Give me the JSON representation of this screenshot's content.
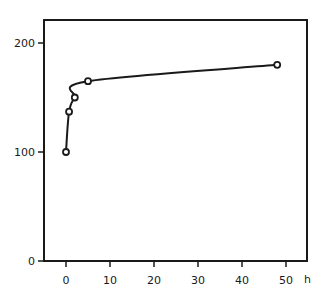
{
  "chart_data": {
    "type": "line",
    "title": "",
    "xlabel": "h",
    "ylabel": "",
    "xlim": [
      -4,
      56
    ],
    "ylim": [
      0,
      220
    ],
    "grid": false,
    "legend": null,
    "x_ticks": [
      "0",
      "10",
      "20",
      "30",
      "40",
      "50"
    ],
    "y_ticks": [
      "0",
      "100",
      "200"
    ],
    "series": [
      {
        "name": "curve",
        "marker": "open-circle",
        "x": [
          0,
          0.7,
          2,
          5,
          48
        ],
        "values": [
          100,
          137,
          150,
          165,
          180
        ]
      }
    ]
  },
  "labels": {
    "x_unit": "h"
  }
}
